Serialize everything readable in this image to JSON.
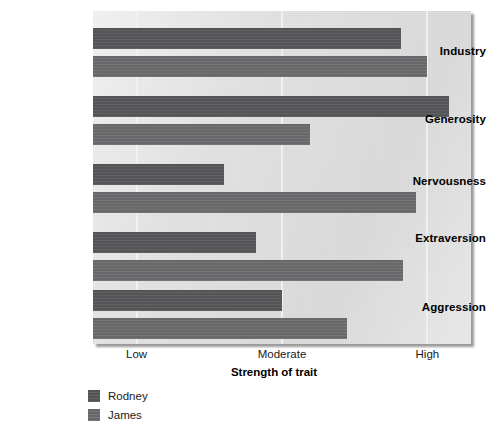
{
  "chart_data": {
    "type": "bar",
    "orientation": "horizontal",
    "title": "",
    "xlabel": "Strength of trait",
    "ylabel": "",
    "categories": [
      "Industry",
      "Generosity",
      "Nervousness",
      "Extraversion",
      "Aggression"
    ],
    "tick_labels": [
      "Low",
      "Moderate",
      "High"
    ],
    "tick_values": [
      1,
      2,
      3
    ],
    "xlim": [
      0.7,
      3.3
    ],
    "grid": true,
    "legend_position": "bottom-left",
    "series": [
      {
        "name": "Rodney",
        "color": "#58585a",
        "values": [
          2.82,
          3.15,
          1.6,
          1.82,
          2.0
        ]
      },
      {
        "name": "James",
        "color": "#6d6d6f",
        "values": [
          3.0,
          2.19,
          2.92,
          2.83,
          2.45
        ]
      }
    ]
  },
  "axis": {
    "title": "Strength of trait",
    "ticks": [
      {
        "label": "Low",
        "value": 1
      },
      {
        "label": "Moderate",
        "value": 2
      },
      {
        "label": "High",
        "value": 3
      }
    ]
  },
  "categories": [
    {
      "label": "Industry"
    },
    {
      "label": "Generosity"
    },
    {
      "label": "Nervousness"
    },
    {
      "label": "Extraversion"
    },
    {
      "label": "Aggression"
    }
  ],
  "legend": {
    "items": [
      {
        "label": "Rodney",
        "color": "#58585a"
      },
      {
        "label": "James",
        "color": "#6d6d6f"
      }
    ]
  },
  "colors": {
    "plot_background": "#dcdcdc",
    "gridline": "#f2f2f2",
    "rodney": "#58585a",
    "james": "#6d6d6f",
    "page_background": "#ffffff",
    "text": "#000000"
  }
}
